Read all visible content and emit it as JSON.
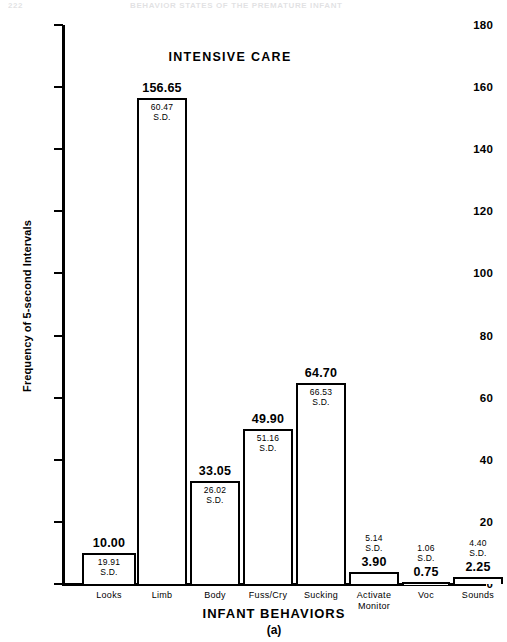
{
  "page_header": {
    "folio": "222",
    "running_head": "BEHAVIOR STATES OF THE PREMATURE INFANT"
  },
  "chart_data": {
    "type": "bar",
    "title": "INTENSIVE CARE",
    "panel_letter": "(a)",
    "xlabel": "INFANT BEHAVIORS",
    "ylabel": "Frequency of 5-second Intervals",
    "ylim": [
      0,
      180
    ],
    "ytick_step": 20,
    "yticks": [
      0,
      20,
      40,
      60,
      80,
      100,
      120,
      140,
      160,
      180
    ],
    "ytick_labels": [
      "0",
      "20",
      "40",
      "60",
      "80",
      "100",
      "120",
      "140",
      "160",
      "180"
    ],
    "grid": false,
    "legend": false,
    "sd_suffix": "S.D.",
    "categories": [
      "Looks",
      "Limb",
      "Body",
      "Fuss/Cry",
      "Sucking",
      "Activate Monitor",
      "Voc",
      "Sounds"
    ],
    "values": [
      10.0,
      156.65,
      33.05,
      49.9,
      64.7,
      3.9,
      0.75,
      2.25
    ],
    "sd": [
      19.91,
      60.47,
      26.02,
      51.16,
      66.53,
      5.14,
      1.06,
      4.4
    ],
    "bars": [
      {
        "label": "Looks",
        "label_line2": "",
        "value": "10.00",
        "sd": "19.91",
        "sd_label": "S.D."
      },
      {
        "label": "Limb",
        "label_line2": "",
        "value": "156.65",
        "sd": "60.47",
        "sd_label": "S.D."
      },
      {
        "label": "Body",
        "label_line2": "",
        "value": "33.05",
        "sd": "26.02",
        "sd_label": "S.D."
      },
      {
        "label": "Fuss/Cry",
        "label_line2": "",
        "value": "49.90",
        "sd": "51.16",
        "sd_label": "S.D."
      },
      {
        "label": "Sucking",
        "label_line2": "",
        "value": "64.70",
        "sd": "66.53",
        "sd_label": "S.D."
      },
      {
        "label": "Activate",
        "label_line2": "Monitor",
        "value": "3.90",
        "sd": "5.14",
        "sd_label": "S.D."
      },
      {
        "label": "Voc",
        "label_line2": "",
        "value": "0.75",
        "sd": "1.06",
        "sd_label": "S.D."
      },
      {
        "label": "Sounds",
        "label_line2": "",
        "value": "2.25",
        "sd": "4.40",
        "sd_label": "S.D."
      }
    ]
  }
}
